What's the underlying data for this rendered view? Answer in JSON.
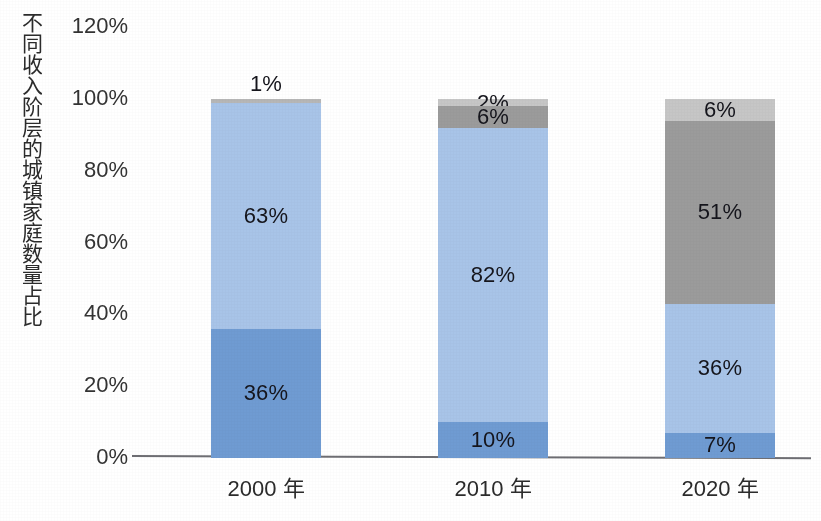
{
  "chart_data": {
    "type": "bar",
    "subtype": "stacked-bar-100",
    "title": "",
    "xlabel": "",
    "ylabel": "不同收入阶层的城镇家庭数量占比",
    "categories": [
      "2000 年",
      "2010 年",
      "2020 年"
    ],
    "ylim": [
      0,
      120
    ],
    "ytick_labels": [
      "120%",
      "100%",
      "80%",
      "60%",
      "40%",
      "20%",
      "0%"
    ],
    "ytick_values": [
      120,
      100,
      80,
      60,
      40,
      20,
      0
    ],
    "grid": false,
    "legend": "none",
    "series": [
      {
        "name": "最低收入层",
        "color": "#6f9bd2",
        "values": [
          36,
          10,
          7
        ],
        "labels": [
          "36%",
          "10%",
          "7%"
        ]
      },
      {
        "name": "中低收入层",
        "color": "#a8c4e8",
        "values": [
          63,
          82,
          36
        ],
        "labels": [
          "63%",
          "82%",
          "36%"
        ]
      },
      {
        "name": "中高收入层",
        "color": "#9b9b9b",
        "values": [
          1,
          6,
          51
        ],
        "labels": [
          "1%",
          "6%",
          "51%"
        ]
      },
      {
        "name": "最高收入层",
        "color": "#c6c6c6",
        "values": [
          0,
          2,
          6
        ],
        "labels": [
          "",
          "2%",
          "6%"
        ]
      }
    ]
  },
  "axis": {
    "y_title": "不同收入阶层的城镇家庭数量占比",
    "ticks": [
      {
        "label": "120%",
        "value": 120
      },
      {
        "label": "100%",
        "value": 100
      },
      {
        "label": "80%",
        "value": 80
      },
      {
        "label": "60%",
        "value": 60
      },
      {
        "label": "40%",
        "value": 40
      },
      {
        "label": "20%",
        "value": 20
      },
      {
        "label": "0%",
        "value": 0
      }
    ]
  },
  "bars": [
    {
      "category": "2000 年",
      "segments": [
        {
          "label": "36%",
          "value": 36,
          "color": "#6f9bd2",
          "label_position": "inside"
        },
        {
          "label": "63%",
          "value": 63,
          "color": "#a8c4e8",
          "label_position": "inside"
        },
        {
          "label": "1%",
          "value": 1,
          "color": "#b6b6b6",
          "label_position": "outside"
        }
      ]
    },
    {
      "category": "2010 年",
      "segments": [
        {
          "label": "10%",
          "value": 10,
          "color": "#6f9bd2",
          "label_position": "inside"
        },
        {
          "label": "82%",
          "value": 82,
          "color": "#a8c4e8",
          "label_position": "inside"
        },
        {
          "label": "6%",
          "value": 6,
          "color": "#9b9b9b",
          "label_position": "inside"
        },
        {
          "label": "2%",
          "value": 2,
          "color": "#c6c6c6",
          "label_position": "inside"
        }
      ]
    },
    {
      "category": "2020 年",
      "segments": [
        {
          "label": "7%",
          "value": 7,
          "color": "#6f9bd2",
          "label_position": "inside"
        },
        {
          "label": "36%",
          "value": 36,
          "color": "#a8c4e8",
          "label_position": "inside"
        },
        {
          "label": "51%",
          "value": 51,
          "color": "#9b9b9b",
          "label_position": "inside"
        },
        {
          "label": "6%",
          "value": 6,
          "color": "#c6c6c6",
          "label_position": "inside"
        }
      ]
    }
  ],
  "colors": {
    "bar_dark_blue": "#6f9bd2",
    "bar_light_blue": "#a8c4e8",
    "bar_dark_gray": "#9b9b9b",
    "bar_light_gray": "#c6c6c6",
    "axis_line": "#6e6e73",
    "text": "#1d1d1d"
  },
  "layout": {
    "baseline_y": 458,
    "pixels_per_percent": 3.59,
    "bar_width": 110,
    "bar_left_positions": [
      79,
      306,
      533
    ],
    "plot_left": 132
  }
}
